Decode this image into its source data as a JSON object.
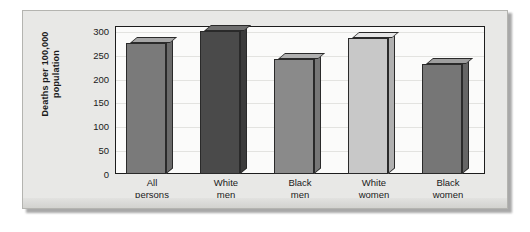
{
  "chart_data": {
    "type": "bar",
    "title": "",
    "subtitle": "",
    "xlabel": "",
    "ylabel": "Deaths per 100,000 population",
    "ylabel_line1": "Deaths per 100,000",
    "ylabel_line2": "population",
    "categories": [
      "All persons",
      "White men",
      "Black men",
      "White women",
      "Black women"
    ],
    "categories_wrapped": [
      [
        "All",
        "persons"
      ],
      [
        "White",
        "men"
      ],
      [
        "Black",
        "men"
      ],
      [
        "White",
        "women"
      ],
      [
        "Black",
        "women"
      ]
    ],
    "values": [
      275,
      300,
      240,
      285,
      230
    ],
    "ylim": [
      0,
      310
    ],
    "yticks": [
      0,
      50,
      100,
      150,
      200,
      250,
      300
    ],
    "ytick_labels": [
      "0",
      "50",
      "100",
      "150",
      "200",
      "250",
      "300"
    ],
    "grid": true,
    "legend": "none",
    "style": "3d-bars",
    "bar_colors": [
      "#7a7a7a",
      "#4a4a4a",
      "#8a8a8a",
      "#c8c8c8",
      "#767676"
    ],
    "bar_top_colors": [
      "#a6a6a6",
      "#6f6f6f",
      "#b0b0b0",
      "#e6e6e6",
      "#9e9e9e"
    ],
    "bar_side_colors": [
      "#6a6a6a",
      "#3c3c3c",
      "#777777",
      "#b0b0b0",
      "#656565"
    ],
    "axis_color": "#1d1d1d",
    "plot_background": "#fbfbfa",
    "page_background": "#e8e8e6"
  }
}
